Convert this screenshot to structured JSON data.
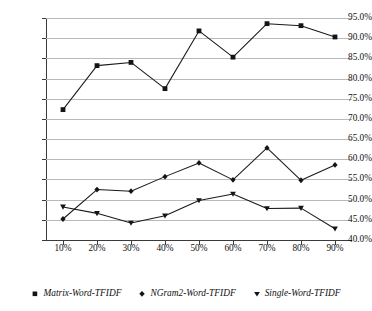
{
  "chart_data": {
    "type": "line",
    "title": "",
    "subtitle": "",
    "xlabel": "",
    "ylabel": "",
    "categories": [
      "10%",
      "20%",
      "30%",
      "40%",
      "50%",
      "60%",
      "70%",
      "80%",
      "90%"
    ],
    "x_values": [
      10,
      20,
      30,
      40,
      50,
      60,
      70,
      80,
      90
    ],
    "ylim": [
      40.0,
      95.0
    ],
    "y_tick_labels": [
      "40.0%",
      "45.0%",
      "50.0%",
      "55.0%",
      "60.0%",
      "65.0%",
      "70.0%",
      "75.0%",
      "80.0%",
      "85.0%",
      "90.0%",
      "95.0%"
    ],
    "y_tick_values": [
      40.0,
      45.0,
      50.0,
      55.0,
      60.0,
      65.0,
      70.0,
      75.0,
      80.0,
      85.0,
      90.0,
      95.0
    ],
    "y_unit": "%",
    "grid": true,
    "grid_axis": "y",
    "legend_position": "bottom",
    "line_color": "#1a1a1a",
    "grid_color": "#b9b9b9",
    "axis_color": "#3a3a3a",
    "series": [
      {
        "name": "Matrix-Word-TFIDF",
        "marker": "square",
        "values": [
          72.3,
          83.2,
          84.0,
          77.5,
          91.8,
          85.3,
          93.6,
          93.1,
          90.3
        ]
      },
      {
        "name": "NGram2-Word-TFIDF",
        "marker": "diamond",
        "values": [
          45.2,
          52.5,
          52.1,
          55.7,
          59.1,
          54.9,
          62.8,
          54.8,
          58.6
        ]
      },
      {
        "name": "Single-Word-TFIDF",
        "marker": "triangle-down",
        "values": [
          48.2,
          46.6,
          44.2,
          46.0,
          49.8,
          51.4,
          47.8,
          47.9,
          42.8
        ]
      }
    ]
  },
  "legend": {
    "items": [
      {
        "label": "Matrix-Word-TFIDF",
        "marker": "square"
      },
      {
        "label": "NGram2-Word-TFIDF",
        "marker": "diamond"
      },
      {
        "label": "Single-Word-TFIDF",
        "marker": "triangle-down"
      }
    ]
  }
}
